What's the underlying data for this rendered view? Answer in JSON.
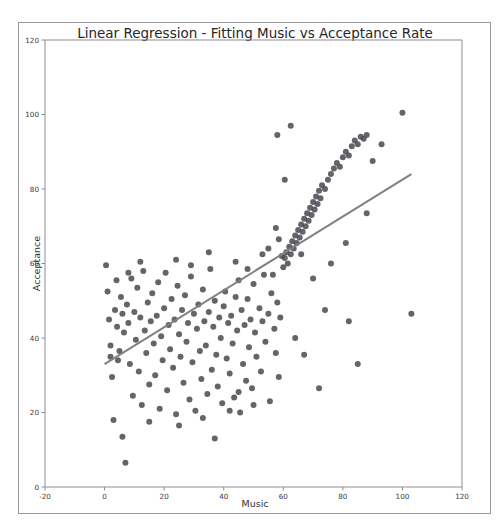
{
  "page": {
    "cutoff_text": "a r g e s t   s e p a r a t i o n   b e t w e e n   g r o u p s   u s i n g   t h e   r e g r e s s i o n   l i n e   a n d   p r o j e c t i o n s"
  },
  "chart_data": {
    "type": "scatter",
    "title": "Linear Regression - Fitting Music vs Acceptance Rate",
    "xlabel": "Music",
    "ylabel": "Acceptance",
    "xlim": [
      -20,
      120
    ],
    "ylim": [
      0,
      120
    ],
    "xticks": [
      -20,
      0,
      20,
      40,
      60,
      80,
      100,
      120
    ],
    "yticks": [
      0,
      20,
      40,
      60,
      80,
      100,
      120
    ],
    "grid": false,
    "legend": "none",
    "point_color": "#4a4a52",
    "point_size": 3,
    "line_color": "#808080",
    "line_width": 2,
    "fit_line": {
      "x": [
        0,
        103
      ],
      "y": [
        33,
        84
      ],
      "slope": 0.495,
      "intercept": 33
    },
    "series": [
      {
        "name": "Data",
        "points": [
          [
            0.5,
            59.5
          ],
          [
            1.0,
            52.5
          ],
          [
            1.5,
            45.0
          ],
          [
            2.0,
            38.0
          ],
          [
            2.5,
            29.5
          ],
          [
            3.0,
            18.0
          ],
          [
            3.5,
            47.5
          ],
          [
            4.0,
            55.5
          ],
          [
            4.2,
            43.0
          ],
          [
            5.0,
            36.5
          ],
          [
            5.5,
            51.0
          ],
          [
            6.0,
            13.5
          ],
          [
            6.5,
            41.5
          ],
          [
            7.0,
            6.5
          ],
          [
            7.5,
            49.0
          ],
          [
            8.0,
            44.0
          ],
          [
            8.5,
            33.0
          ],
          [
            9.0,
            56.0
          ],
          [
            9.5,
            24.5
          ],
          [
            10.0,
            47.0
          ],
          [
            10.5,
            39.5
          ],
          [
            11.0,
            53.5
          ],
          [
            11.5,
            31.0
          ],
          [
            12.0,
            45.5
          ],
          [
            12.5,
            22.0
          ],
          [
            13.0,
            58.0
          ],
          [
            13.5,
            42.0
          ],
          [
            14.0,
            36.0
          ],
          [
            14.5,
            49.5
          ],
          [
            15.0,
            27.5
          ],
          [
            15.5,
            44.5
          ],
          [
            16.0,
            52.0
          ],
          [
            16.5,
            38.5
          ],
          [
            17.0,
            30.0
          ],
          [
            17.5,
            46.0
          ],
          [
            18.0,
            55.0
          ],
          [
            18.5,
            21.0
          ],
          [
            19.0,
            40.5
          ],
          [
            19.5,
            34.0
          ],
          [
            20.0,
            48.0
          ],
          [
            20.5,
            57.5
          ],
          [
            21.0,
            26.0
          ],
          [
            21.5,
            43.5
          ],
          [
            22.0,
            37.0
          ],
          [
            22.5,
            50.5
          ],
          [
            23.0,
            32.0
          ],
          [
            23.5,
            45.0
          ],
          [
            24.0,
            19.5
          ],
          [
            24.5,
            54.0
          ],
          [
            25.0,
            41.0
          ],
          [
            25.5,
            35.0
          ],
          [
            26.0,
            47.5
          ],
          [
            26.5,
            28.0
          ],
          [
            27.0,
            51.5
          ],
          [
            27.5,
            39.0
          ],
          [
            28.0,
            44.0
          ],
          [
            28.5,
            23.5
          ],
          [
            29.0,
            56.5
          ],
          [
            29.5,
            33.5
          ],
          [
            30.0,
            46.5
          ],
          [
            30.5,
            20.5
          ],
          [
            31.0,
            42.5
          ],
          [
            31.5,
            49.0
          ],
          [
            32.0,
            36.5
          ],
          [
            32.5,
            29.0
          ],
          [
            33.0,
            53.0
          ],
          [
            33.5,
            44.5
          ],
          [
            34.0,
            38.0
          ],
          [
            34.5,
            25.0
          ],
          [
            35.0,
            47.0
          ],
          [
            35.5,
            58.5
          ],
          [
            36.0,
            31.5
          ],
          [
            36.5,
            43.0
          ],
          [
            37.0,
            50.0
          ],
          [
            37.5,
            35.5
          ],
          [
            38.0,
            27.0
          ],
          [
            38.5,
            45.5
          ],
          [
            39.0,
            40.0
          ],
          [
            39.5,
            22.5
          ],
          [
            40.0,
            48.5
          ],
          [
            40.5,
            52.5
          ],
          [
            41.0,
            34.5
          ],
          [
            41.5,
            44.0
          ],
          [
            42.0,
            30.5
          ],
          [
            42.5,
            46.0
          ],
          [
            43.0,
            38.5
          ],
          [
            43.5,
            24.0
          ],
          [
            44.0,
            51.0
          ],
          [
            44.5,
            42.0
          ],
          [
            45.0,
            55.5
          ],
          [
            45.5,
            20.0
          ],
          [
            46.0,
            47.5
          ],
          [
            46.5,
            33.0
          ],
          [
            47.0,
            43.5
          ],
          [
            47.5,
            28.5
          ],
          [
            48.0,
            50.5
          ],
          [
            48.5,
            37.5
          ],
          [
            49.0,
            45.0
          ],
          [
            49.5,
            26.5
          ],
          [
            50.0,
            54.5
          ],
          [
            50.5,
            41.5
          ],
          [
            51.0,
            35.0
          ],
          [
            52.0,
            48.0
          ],
          [
            52.5,
            31.0
          ],
          [
            53.0,
            44.5
          ],
          [
            53.5,
            57.0
          ],
          [
            54.0,
            39.0
          ],
          [
            55.0,
            46.5
          ],
          [
            55.5,
            23.0
          ],
          [
            56.0,
            52.0
          ],
          [
            57.0,
            42.5
          ],
          [
            57.5,
            36.0
          ],
          [
            58.0,
            49.5
          ],
          [
            58.5,
            29.5
          ],
          [
            59.0,
            45.5
          ],
          [
            59.5,
            62.0
          ],
          [
            60.0,
            59.0
          ],
          [
            60.5,
            61.5
          ],
          [
            61.0,
            63.0
          ],
          [
            61.5,
            60.0
          ],
          [
            62.0,
            64.5
          ],
          [
            62.5,
            62.5
          ],
          [
            63.0,
            66.0
          ],
          [
            63.5,
            64.0
          ],
          [
            64.0,
            67.5
          ],
          [
            64.5,
            65.5
          ],
          [
            65.0,
            69.0
          ],
          [
            65.5,
            67.0
          ],
          [
            66.0,
            70.5
          ],
          [
            66.5,
            68.5
          ],
          [
            67.0,
            72.0
          ],
          [
            67.5,
            70.0
          ],
          [
            68.0,
            73.5
          ],
          [
            68.5,
            71.5
          ],
          [
            69.0,
            75.0
          ],
          [
            69.5,
            73.0
          ],
          [
            70.0,
            76.5
          ],
          [
            70.5,
            74.5
          ],
          [
            71.0,
            78.0
          ],
          [
            71.5,
            76.0
          ],
          [
            72.0,
            79.5
          ],
          [
            72.5,
            77.5
          ],
          [
            73.0,
            81.0
          ],
          [
            74.0,
            80.0
          ],
          [
            75.0,
            82.5
          ],
          [
            76.0,
            84.0
          ],
          [
            77.0,
            85.5
          ],
          [
            78.0,
            87.0
          ],
          [
            79.0,
            86.0
          ],
          [
            80.0,
            88.5
          ],
          [
            81.0,
            90.0
          ],
          [
            82.0,
            89.0
          ],
          [
            83.0,
            91.5
          ],
          [
            84.0,
            93.0
          ],
          [
            85.0,
            92.0
          ],
          [
            86.0,
            94.0
          ],
          [
            87.0,
            93.5
          ],
          [
            88.0,
            94.5
          ],
          [
            58.0,
            94.5
          ],
          [
            62.5,
            97.0
          ],
          [
            60.5,
            82.5
          ],
          [
            57.5,
            69.5
          ],
          [
            58.5,
            66.5
          ],
          [
            55.0,
            64.0
          ],
          [
            66.0,
            62.5
          ],
          [
            70.0,
            56.0
          ],
          [
            74.0,
            47.5
          ],
          [
            76.0,
            60.0
          ],
          [
            81.0,
            65.5
          ],
          [
            82.0,
            44.5
          ],
          [
            85.0,
            33.0
          ],
          [
            88.0,
            73.5
          ],
          [
            90.0,
            87.5
          ],
          [
            72.0,
            26.5
          ],
          [
            64.0,
            40.0
          ],
          [
            67.0,
            35.5
          ],
          [
            100.0,
            100.5
          ],
          [
            103.0,
            46.5
          ],
          [
            93.0,
            92.0
          ],
          [
            56.5,
            57.0
          ],
          [
            53.0,
            62.5
          ],
          [
            48.0,
            58.5
          ],
          [
            44.0,
            60.5
          ],
          [
            35.0,
            63.0
          ],
          [
            29.0,
            59.5
          ],
          [
            24.0,
            61.0
          ],
          [
            12.0,
            60.5
          ],
          [
            8.0,
            57.5
          ],
          [
            2.0,
            35.0
          ],
          [
            4.5,
            34.0
          ],
          [
            6.0,
            46.5
          ],
          [
            15.0,
            17.5
          ],
          [
            25.0,
            16.5
          ],
          [
            33.0,
            18.5
          ],
          [
            42.0,
            20.5
          ],
          [
            45.0,
            25.5
          ],
          [
            50.0,
            22.0
          ],
          [
            37.0,
            13.0
          ]
        ]
      }
    ]
  }
}
